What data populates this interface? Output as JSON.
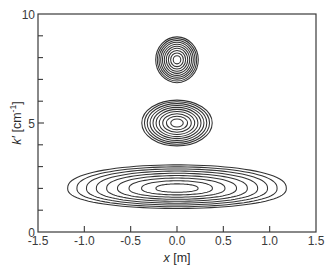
{
  "chart_data": {
    "type": "contour",
    "title": "",
    "xlabel": "x [m]",
    "xlabel_var": "x",
    "xlabel_unit": " [m]",
    "ylabel": "k′ [cm⁻¹]",
    "ylabel_var": "k′",
    "ylabel_unit": " [cm",
    "ylabel_sup": "-1",
    "ylabel_close": "]",
    "xlim": [
      -1.5,
      1.5
    ],
    "ylim": [
      0,
      10
    ],
    "xticks": [
      -1.5,
      -1.0,
      -0.5,
      0.0,
      0.5,
      1.0,
      1.5
    ],
    "xtick_labels": [
      "-1.5",
      "-1.0",
      "-0.5",
      "0.0",
      "0.5",
      "1.0",
      "1.5"
    ],
    "yticks_major": [
      0,
      5,
      10
    ],
    "ytick_labels": [
      "0",
      "5",
      "10"
    ],
    "yticks_minor": [
      1,
      2,
      3,
      4,
      6,
      7,
      8,
      9
    ],
    "grid": false,
    "legend": "none",
    "line_color": "#333333",
    "clusters": [
      {
        "name": "upper",
        "center": [
          0.0,
          7.9
        ],
        "outer_half_width": 0.23,
        "outer_half_height": 1.05,
        "levels": 10,
        "shape": "ellipse"
      },
      {
        "name": "middle",
        "center": [
          0.0,
          5.0
        ],
        "outer_half_width": 0.38,
        "outer_half_height": 1.05,
        "levels": 10,
        "shape": "ellipse"
      },
      {
        "name": "lower",
        "center": [
          0.0,
          2.0
        ],
        "outer_half_width": 1.18,
        "outer_half_height": 1.0,
        "levels": 9,
        "shape": "lens"
      }
    ]
  }
}
